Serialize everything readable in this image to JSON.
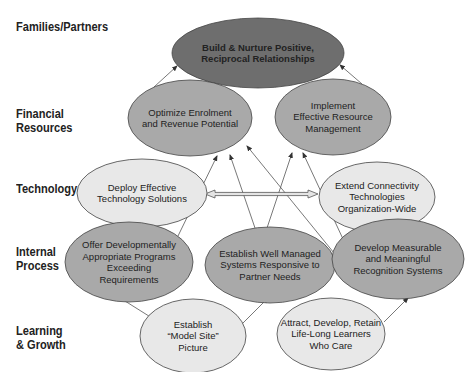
{
  "rows": [
    {
      "label_lines": [
        "Families/Partners"
      ],
      "y": 27
    },
    {
      "label_lines": [
        "Financial",
        "Resources"
      ],
      "y": 114
    },
    {
      "label_lines": [
        "Technology"
      ],
      "y": 189
    },
    {
      "label_lines": [
        "Internal",
        "Process"
      ],
      "y": 252
    },
    {
      "label_lines": [
        "Learning",
        "& Growth"
      ],
      "y": 331
    }
  ],
  "colors": {
    "dark_fill": "#6e6e6e",
    "mid_fill": "#a9a9a9",
    "light_fill": "#e8e8e8",
    "stroke": "#444444",
    "arrow": "#555555"
  },
  "nodes": [
    {
      "id": "build-nurture",
      "row": "Families/Partners",
      "lines": [
        "Build & Nurture Positive,",
        "Reciprocal Relationships"
      ],
      "cx": 258,
      "cy": 53,
      "rx": 86,
      "ry": 35,
      "fill": "dark",
      "bold": true
    },
    {
      "id": "optimize-enrolment",
      "row": "Financial Resources",
      "lines": [
        "Optimize Enrolment",
        "and Revenue Potential"
      ],
      "cx": 190,
      "cy": 118,
      "rx": 62,
      "ry": 38,
      "fill": "mid"
    },
    {
      "id": "implement-resource",
      "row": "Financial Resources",
      "lines": [
        "Implement",
        "Effective Resource",
        "Management"
      ],
      "cx": 333,
      "cy": 117,
      "rx": 58,
      "ry": 38,
      "fill": "mid"
    },
    {
      "id": "deploy-technology",
      "row": "Technology",
      "lines": [
        "Deploy Effective",
        "Technology Solutions"
      ],
      "cx": 142,
      "cy": 193,
      "rx": 65,
      "ry": 34,
      "fill": "light"
    },
    {
      "id": "extend-connectivity",
      "row": "Technology",
      "lines": [
        "Extend Connectivity",
        "Technologies",
        "Organization-Wide"
      ],
      "cx": 377,
      "cy": 197,
      "rx": 58,
      "ry": 35,
      "fill": "light"
    },
    {
      "id": "offer-programs",
      "row": "Internal Process",
      "lines": [
        "Offer Developmentally",
        "Appropriate Programs",
        "Exceeding",
        "Requirements"
      ],
      "cx": 129,
      "cy": 262,
      "rx": 64,
      "ry": 40,
      "fill": "mid"
    },
    {
      "id": "establish-systems",
      "row": "Internal Process",
      "lines": [
        "Establish Well Managed",
        "Systems Responsive to",
        "Partner Needs"
      ],
      "cx": 270,
      "cy": 265,
      "rx": 65,
      "ry": 38,
      "fill": "mid"
    },
    {
      "id": "develop-recognition",
      "row": "Internal Process",
      "lines": [
        "Develop Measurable",
        "and Meaningful",
        "Recognition Systems"
      ],
      "cx": 398,
      "cy": 259,
      "rx": 66,
      "ry": 40,
      "fill": "mid"
    },
    {
      "id": "model-site",
      "row": "Learning & Growth",
      "lines": [
        "Establish",
        "“Model Site”",
        "Picture"
      ],
      "cx": 193,
      "cy": 336,
      "rx": 53,
      "ry": 37,
      "fill": "light"
    },
    {
      "id": "attract-learners",
      "row": "Learning & Growth",
      "lines": [
        "Attract, Develop, Retain",
        "Life-Long Learners",
        "Who Care"
      ],
      "cx": 331,
      "cy": 334,
      "rx": 54,
      "ry": 36,
      "fill": "light"
    }
  ],
  "edges": [
    {
      "from": "optimize-enrolment",
      "to": "build-nurture",
      "x1": 154,
      "y1": 87,
      "x2": 177,
      "y2": 66
    },
    {
      "from": "implement-resource",
      "to": "build-nurture",
      "x1": 362,
      "y1": 84,
      "x2": 340,
      "y2": 65
    },
    {
      "from": "offer-programs",
      "to": "optimize-enrolment",
      "x1": 178,
      "y1": 236,
      "x2": 217,
      "y2": 156
    },
    {
      "from": "establish-systems",
      "to": "optimize-enrolment",
      "x1": 255,
      "y1": 228,
      "x2": 230,
      "y2": 155
    },
    {
      "from": "develop-recognition",
      "to": "optimize-enrolment",
      "x1": 334,
      "y1": 253,
      "x2": 247,
      "y2": 146
    },
    {
      "from": "establish-systems",
      "to": "implement-resource",
      "x1": 267,
      "y1": 228,
      "x2": 292,
      "y2": 153
    },
    {
      "from": "develop-recognition",
      "to": "implement-resource",
      "x1": 343,
      "y1": 239,
      "x2": 303,
      "y2": 153
    },
    {
      "from": "model-site",
      "to": "offer-programs",
      "x1": 152,
      "y1": 318,
      "x2": 117,
      "y2": 296
    },
    {
      "from": "model-site",
      "to": "establish-systems",
      "x1": 239,
      "y1": 327,
      "x2": 268,
      "y2": 298
    },
    {
      "from": "attract-learners",
      "to": "develop-recognition",
      "x1": 384,
      "y1": 322,
      "x2": 408,
      "y2": 298
    }
  ],
  "double_arrow": {
    "between": [
      "deploy-technology",
      "extend-connectivity"
    ],
    "x1": 205,
    "x2": 318,
    "y": 194
  }
}
